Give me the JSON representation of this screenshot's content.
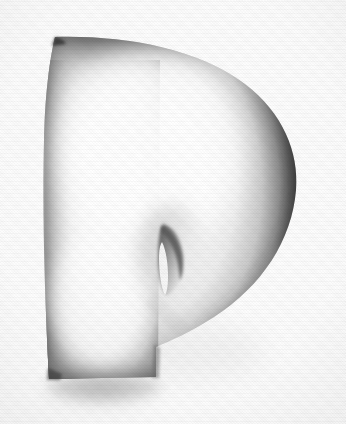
{
  "artwork": {
    "title": "Letter P",
    "subject": "uppercase-letter-p",
    "style": "airbrushed 3d inflated glyph",
    "character": "P",
    "alt_text": "A stylized three-dimensional airbrushed uppercase letter P, white with soft dark shaded edges, casting a soft shadow",
    "background_label": "white paper with horizontal scanline texture"
  },
  "colors": {
    "background": "#fdfdfd",
    "paper_tint": "#f7f7f7",
    "glyph_fill": "#f4f4f4",
    "glyph_highlight": "#ffffff",
    "edge_dark": "#3c3c3c",
    "edge_mid": "#8a8a8a",
    "edge_light": "#cfcfcf",
    "shadow": "#b8b8b8",
    "counter_dark": "#6e6e6e"
  },
  "geometry": {
    "canvas_width": 346,
    "canvas_height": 424,
    "glyph_bounds": {
      "x": 42,
      "y": 36,
      "width": 255,
      "height": 344
    },
    "stem_bottom_y": 379,
    "stem_left_x": 48,
    "stem_right_x": 156,
    "bowl_right_x": 297,
    "counter_bounds": {
      "x": 156,
      "y": 221,
      "width": 29,
      "height": 75
    },
    "shadow_bounds": {
      "x": 40,
      "y": 376,
      "width": 130,
      "height": 40
    }
  },
  "layers": [
    {
      "name": "background",
      "label": "Background"
    },
    {
      "name": "drop-shadow",
      "label": "Drop shadow"
    },
    {
      "name": "glyph-body",
      "label": "Glyph body"
    },
    {
      "name": "counter",
      "label": "Counter hole"
    },
    {
      "name": "scanlines",
      "label": "Scanline texture"
    }
  ]
}
